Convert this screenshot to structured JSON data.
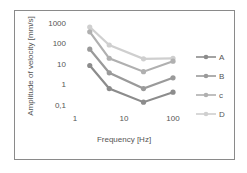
{
  "chart_data": {
    "type": "line",
    "title": "",
    "xlabel": "Frequency [Hz]",
    "ylabel": "Amplitude of velocity [mm/s]",
    "x_scale": "log",
    "y_scale": "log",
    "x_ticks": [
      "1",
      "10",
      "100"
    ],
    "y_ticks": [
      "1000",
      "100",
      "10",
      "1",
      "0,1"
    ],
    "xlim": [
      1,
      100
    ],
    "ylim": [
      0.1,
      1000
    ],
    "grid": false,
    "legend_position": "right",
    "x": [
      2,
      5,
      25,
      100
    ],
    "series": [
      {
        "name": "A",
        "values": [
          8,
          0.6,
          0.13,
          0.4
        ],
        "color": "#8c8c8c"
      },
      {
        "name": "B",
        "values": [
          50,
          3.5,
          0.6,
          2
        ],
        "color": "#9a9a9a"
      },
      {
        "name": "c",
        "values": [
          350,
          18,
          4,
          13
        ],
        "color": "#b0b0b0"
      },
      {
        "name": "D",
        "values": [
          600,
          80,
          17,
          18
        ],
        "color": "#cfcfcf"
      }
    ]
  }
}
